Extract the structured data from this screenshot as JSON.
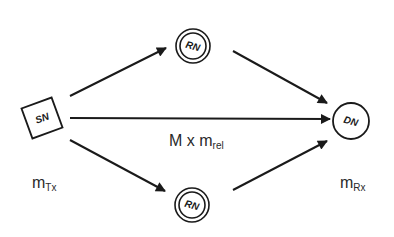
{
  "diagram": {
    "type": "relay network",
    "nodes": [
      {
        "id": "SN",
        "label": "SN",
        "shape": "square",
        "role": "source node"
      },
      {
        "id": "RN1",
        "label": "RN",
        "shape": "double-circle",
        "role": "relay node (top)"
      },
      {
        "id": "RN2",
        "label": "RN",
        "shape": "double-circle",
        "role": "relay node (bottom)"
      },
      {
        "id": "DN",
        "label": "DN",
        "shape": "circle",
        "role": "destination node"
      }
    ],
    "edges": [
      {
        "from": "SN",
        "to": "RN1"
      },
      {
        "from": "RN1",
        "to": "DN"
      },
      {
        "from": "SN",
        "to": "DN"
      },
      {
        "from": "SN",
        "to": "RN2"
      },
      {
        "from": "RN2",
        "to": "DN"
      }
    ],
    "labels": {
      "direct_link": {
        "main": "M x m",
        "sub": "rel"
      },
      "transmitter": {
        "main": "m",
        "sub": "Tx"
      },
      "receiver": {
        "main": "m",
        "sub": "Rx"
      }
    },
    "colors": {
      "stroke": "#1a1a1a",
      "background": "#ffffff"
    }
  }
}
